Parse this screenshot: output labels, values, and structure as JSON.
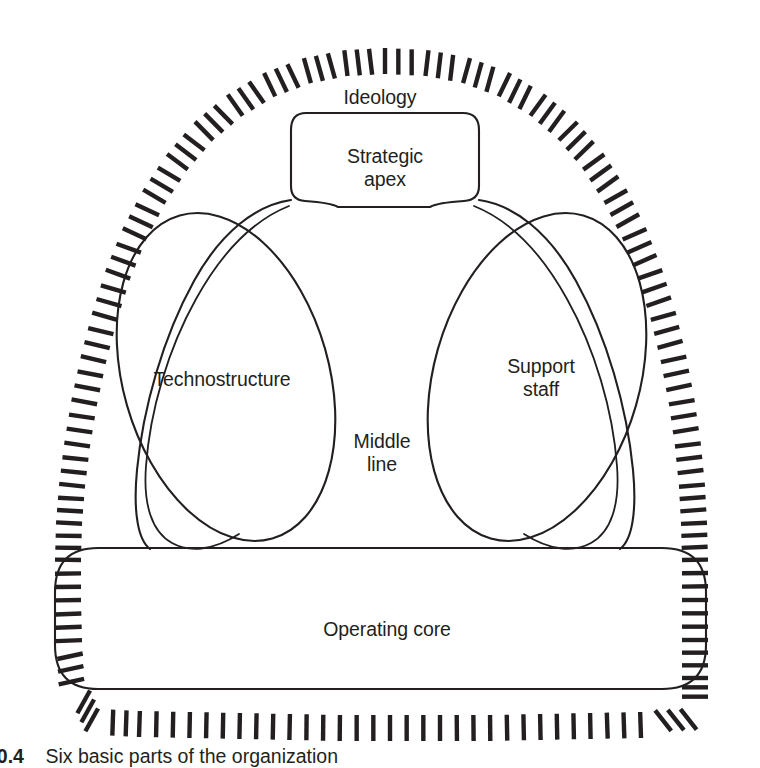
{
  "figure": {
    "caption_number": "20.4",
    "caption_text": "Six basic parts of the organization",
    "background_color": "#ffffff",
    "ink_color": "#231f20"
  },
  "diagram": {
    "type": "organizational-structure-diagram",
    "title": "Six basic parts of the organization",
    "parts": [
      {
        "id": "ideology",
        "label": "Ideology",
        "shape": "radiating-hash-halo",
        "position": "surrounding-envelope-top"
      },
      {
        "id": "strategic-apex",
        "label": "Strategic\napex",
        "shape": "rounded-rectangle",
        "position": "top-center"
      },
      {
        "id": "technostructure",
        "label": "Technostructure",
        "shape": "tilted-ellipse",
        "position": "left"
      },
      {
        "id": "support-staff",
        "label": "Support\nstaff",
        "shape": "tilted-ellipse",
        "position": "right"
      },
      {
        "id": "middle-line",
        "label": "Middle\nline",
        "shape": "central-column",
        "position": "center"
      },
      {
        "id": "operating-core",
        "label": "Operating core",
        "shape": "wide-rounded-rectangle",
        "position": "bottom"
      }
    ]
  }
}
